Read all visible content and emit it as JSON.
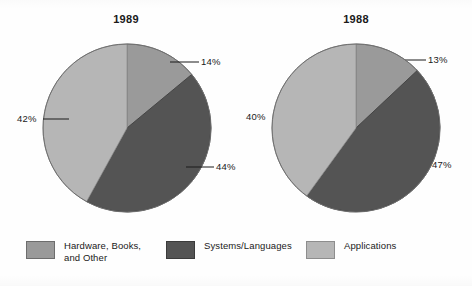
{
  "figure": {
    "background": "#fefefe"
  },
  "chart_data": [
    {
      "type": "pie",
      "title": "1989",
      "categories": [
        "Hardware, Books, and Other",
        "Systems/Languages",
        "Applications"
      ],
      "values": [
        14,
        44,
        42
      ],
      "labels": [
        "14%",
        "44%",
        "42%"
      ],
      "colors": [
        "#9a9a9a",
        "#545454",
        "#b6b6b6"
      ],
      "start_angle_deg": 0,
      "direction": "clockwise",
      "units": "percent",
      "legend_position": "bottom"
    },
    {
      "type": "pie",
      "title": "1988",
      "categories": [
        "Hardware, Books, and Other",
        "Systems/Languages",
        "Applications"
      ],
      "values": [
        13,
        47,
        40
      ],
      "labels": [
        "13%",
        "47%",
        "40%"
      ],
      "colors": [
        "#9a9a9a",
        "#545454",
        "#b6b6b6"
      ],
      "start_angle_deg": 0,
      "direction": "clockwise",
      "units": "percent",
      "legend_position": "bottom"
    }
  ],
  "charts": {
    "left": {
      "title": "1989",
      "slice_hardware_label": "14%",
      "slice_systems_label": "44%",
      "slice_applications_label": "42%"
    },
    "right": {
      "title": "1988",
      "slice_hardware_label": "13%",
      "slice_systems_label": "47%",
      "slice_applications_label": "40%"
    }
  },
  "legend": {
    "items": [
      {
        "label": "Hardware, Books,\nand Other",
        "color": "#9a9a9a"
      },
      {
        "label": "Systems/Languages",
        "color": "#545454"
      },
      {
        "label": "Applications",
        "color": "#b6b6b6"
      }
    ]
  }
}
